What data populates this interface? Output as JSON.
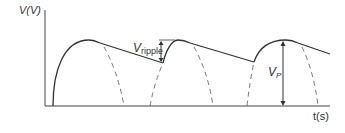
{
  "figure": {
    "type": "half-wave rectifier output with capacitor filter (ripple)",
    "axes": {
      "y_label": "V(V)",
      "x_label": "t(s)"
    },
    "annotations": {
      "ripple_label_main": "V",
      "ripple_label_sub": "ripple",
      "peak_label_main": "V",
      "peak_label_sub": "P"
    },
    "colors": {
      "line": "#333333",
      "dashed": "#666666",
      "background": "#ffffff"
    },
    "waveform": {
      "solid": "rectified sine rising segments + linear capacitor discharge",
      "dashed": "unfiltered half-sine continuation",
      "cycles": 3
    }
  }
}
